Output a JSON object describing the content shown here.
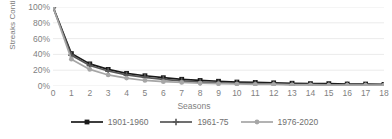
{
  "chart_data": {
    "type": "line",
    "title": "",
    "xlabel": "Seasons",
    "ylabel": "Streaks Continuing",
    "x": [
      0,
      1,
      2,
      3,
      4,
      5,
      6,
      7,
      8,
      9,
      10,
      11,
      12,
      13,
      14,
      15,
      16,
      17,
      18
    ],
    "xlim": [
      0,
      18
    ],
    "ylim": [
      0,
      100
    ],
    "yticks": [
      "0%",
      "20%",
      "40%",
      "60%",
      "80%",
      "100%"
    ],
    "ytick_values": [
      0,
      20,
      40,
      60,
      80,
      100
    ],
    "xticks": [
      "0",
      "1",
      "2",
      "3",
      "4",
      "5",
      "6",
      "7",
      "8",
      "9",
      "10",
      "11",
      "12",
      "13",
      "14",
      "15",
      "16",
      "17",
      "18"
    ],
    "grid": true,
    "legend_position": "bottom",
    "series": [
      {
        "name": "1901-1960",
        "color": "#1a1a1a",
        "marker": "square",
        "values": [
          100,
          41,
          28,
          21,
          16,
          13,
          10.5,
          8.5,
          7,
          6,
          5,
          4.5,
          4,
          3.5,
          3,
          3,
          2.5,
          2.5,
          2
        ]
      },
      {
        "name": "1961-75",
        "color": "#575757",
        "marker": "plus",
        "values": [
          100,
          39,
          26,
          19,
          14,
          11,
          8.5,
          6.5,
          5,
          4,
          3.5,
          3,
          2.5,
          2,
          2,
          1.5,
          1.5,
          1,
          1
        ]
      },
      {
        "name": "1976-2020",
        "color": "#a6a6a6",
        "marker": "circle",
        "values": [
          100,
          34,
          21,
          14,
          10,
          7,
          5.5,
          4.5,
          3.5,
          3,
          2.5,
          2,
          2,
          1.5,
          1.5,
          1,
          1,
          1,
          1
        ]
      }
    ]
  },
  "axis": {
    "ylabel": "Streaks Continuing",
    "xlabel": "Seasons"
  },
  "colors": {
    "series1": "#1a1a1a",
    "series2": "#575757",
    "series3": "#a6a6a6",
    "grid": "#e6e6e6",
    "text": "#7f7f7f",
    "background": "#ffffff"
  }
}
